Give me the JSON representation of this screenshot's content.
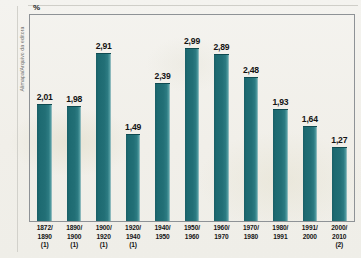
{
  "credit": "Alimapa/Arquivo da editora",
  "axis": {
    "y_unit": "%"
  },
  "chart_data": {
    "type": "bar",
    "title": "",
    "subtitle": "",
    "xlabel": "",
    "ylabel": "%",
    "ylim": [
      0,
      3.2
    ],
    "grid": false,
    "legend": "none",
    "categories": [
      "1872/\n1890\n(1)",
      "1890/\n1900\n(1)",
      "1900/\n1920\n(1)",
      "1920/\n1940\n(1)",
      "1940/\n1950",
      "1950/\n1960",
      "1960/\n1970",
      "1970/\n1980",
      "1980/\n1991",
      "1991/\n2000",
      "2000/\n2010\n(2)"
    ],
    "values": [
      2.01,
      1.98,
      2.91,
      1.49,
      2.39,
      2.99,
      2.89,
      2.48,
      1.93,
      1.64,
      1.27
    ],
    "value_labels": [
      "2,01",
      "1,98",
      "2,91",
      "1,49",
      "2,39",
      "2,99",
      "2,89",
      "2,48",
      "1,93",
      "1,64",
      "1,27"
    ],
    "bar_color": "#216c73",
    "series": [
      {
        "name": "Taxa",
        "values": [
          2.01,
          1.98,
          2.91,
          1.49,
          2.39,
          2.99,
          2.89,
          2.48,
          1.93,
          1.64,
          1.27
        ]
      }
    ]
  },
  "ticks": [
    {
      "line1": "1872/",
      "line2": "1890",
      "line3": "(1)"
    },
    {
      "line1": "1890/",
      "line2": "1900",
      "line3": "(1)"
    },
    {
      "line1": "1900/",
      "line2": "1920",
      "line3": "(1)"
    },
    {
      "line1": "1920/",
      "line2": "1940",
      "line3": "(1)"
    },
    {
      "line1": "1940/",
      "line2": "1950",
      "line3": ""
    },
    {
      "line1": "1950/",
      "line2": "1960",
      "line3": ""
    },
    {
      "line1": "1960/",
      "line2": "1970",
      "line3": ""
    },
    {
      "line1": "1970/",
      "line2": "1980",
      "line3": ""
    },
    {
      "line1": "1980/",
      "line2": "1991",
      "line3": ""
    },
    {
      "line1": "1991/",
      "line2": "2000",
      "line3": ""
    },
    {
      "line1": "2000/",
      "line2": "2010",
      "line3": "(2)"
    }
  ]
}
